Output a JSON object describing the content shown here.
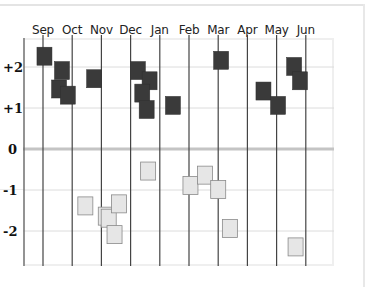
{
  "chart_data": {
    "type": "scatter",
    "title": "",
    "xlabel": "",
    "ylabel": "",
    "ylim": [
      -2.8,
      2.7
    ],
    "grid": true,
    "legend": null,
    "x_tick_labels": [
      "Sep",
      "Oct",
      "Nov",
      "Dec",
      "Jan",
      "Feb",
      "Mar",
      "Apr",
      "May",
      "Jun"
    ],
    "y_tick_labels": [
      "+2",
      "+1",
      "0",
      "-1",
      "-2"
    ],
    "y_ticks": [
      2,
      1,
      0,
      -1,
      -2
    ],
    "series": [
      {
        "name": "positive",
        "color": "#3a3a3a",
        "points": [
          {
            "month": "Sep",
            "x": 0.55,
            "y": 2.3
          },
          {
            "month": "Oct",
            "x": 1.15,
            "y": 1.95
          },
          {
            "month": "Oct",
            "x": 1.05,
            "y": 1.5
          },
          {
            "month": "Oct",
            "x": 1.35,
            "y": 1.35
          },
          {
            "month": "Nov",
            "x": 2.25,
            "y": 1.75
          },
          {
            "month": "Dec",
            "x": 3.75,
            "y": 1.95
          },
          {
            "month": "Dec",
            "x": 4.15,
            "y": 1.7
          },
          {
            "month": "Dec",
            "x": 3.9,
            "y": 1.4
          },
          {
            "month": "Jan",
            "x": 4.05,
            "y": 1.0
          },
          {
            "month": "Jan",
            "x": 4.95,
            "y": 1.1
          },
          {
            "month": "Mar",
            "x": 6.6,
            "y": 2.2
          },
          {
            "month": "May",
            "x": 8.05,
            "y": 1.45
          },
          {
            "month": "May",
            "x": 8.55,
            "y": 1.1
          },
          {
            "month": "Jun",
            "x": 9.1,
            "y": 2.05
          },
          {
            "month": "Jun",
            "x": 9.3,
            "y": 1.7
          }
        ]
      },
      {
        "name": "negative",
        "color": "#e6e6e6",
        "points": [
          {
            "month": "Nov",
            "x": 1.95,
            "y": -1.4
          },
          {
            "month": "Dec",
            "x": 2.65,
            "y": -1.65
          },
          {
            "month": "Dec",
            "x": 2.75,
            "y": -1.7
          },
          {
            "month": "Dec",
            "x": 3.1,
            "y": -1.35
          },
          {
            "month": "Dec",
            "x": 2.95,
            "y": -2.1
          },
          {
            "month": "Jan",
            "x": 4.1,
            "y": -0.55
          },
          {
            "month": "Feb",
            "x": 5.55,
            "y": -0.9
          },
          {
            "month": "Mar",
            "x": 6.05,
            "y": -0.65
          },
          {
            "month": "Mar",
            "x": 6.5,
            "y": -1.0
          },
          {
            "month": "Apr",
            "x": 6.9,
            "y": -1.95
          },
          {
            "month": "Jun",
            "x": 9.15,
            "y": -2.4
          }
        ]
      }
    ]
  }
}
